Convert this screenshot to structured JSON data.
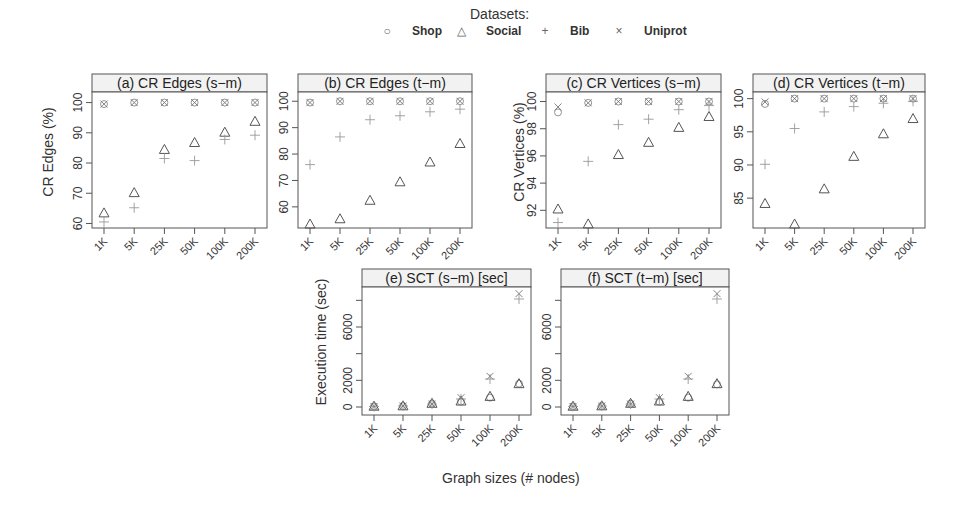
{
  "legend": {
    "title": "Datasets:",
    "items": [
      {
        "label": "Shop",
        "symbol": "○"
      },
      {
        "label": "Social",
        "symbol": "△"
      },
      {
        "label": "Bib",
        "symbol": "+"
      },
      {
        "label": "Uniprot",
        "symbol": "×"
      }
    ]
  },
  "xlabel": "Graph sizes (# nodes)",
  "ylabels": {
    "edges": "CR Edges (%)",
    "vertices": "CR Vertices (%)",
    "time": "Execution time (sec)"
  },
  "chart_data": [
    {
      "type": "scatter",
      "title": "(a) CR Edges (s−m)",
      "xlabel": "Graph sizes (# nodes)",
      "ylabel": "CR Edges (%)",
      "categories": [
        "1K",
        "5K",
        "25K",
        "50K",
        "100K",
        "200K"
      ],
      "yticks": [
        60,
        70,
        80,
        90,
        100
      ],
      "ylim": [
        58.5,
        103.5
      ],
      "series": [
        {
          "name": "Shop",
          "values": [
            99.5,
            100,
            100,
            100,
            100,
            100
          ]
        },
        {
          "name": "Social",
          "values": [
            63.5,
            70.2,
            84.5,
            86.8,
            90.2,
            93.8
          ]
        },
        {
          "name": "Bib",
          "values": [
            60.5,
            65.2,
            81.5,
            80.8,
            87.8,
            89.2
          ]
        },
        {
          "name": "Uniprot",
          "values": [
            99.5,
            100,
            100,
            100,
            100,
            100
          ]
        }
      ]
    },
    {
      "type": "scatter",
      "title": "(b) CR Edges (t−m)",
      "xlabel": "Graph sizes (# nodes)",
      "ylabel": "CR Edges (%)",
      "categories": [
        "1K",
        "5K",
        "25K",
        "50K",
        "100K",
        "200K"
      ],
      "yticks": [
        60,
        70,
        80,
        90,
        100
      ],
      "ylim": [
        52,
        103.5
      ],
      "series": [
        {
          "name": "Shop",
          "values": [
            99.5,
            100,
            100,
            100,
            100,
            100
          ]
        },
        {
          "name": "Social",
          "values": [
            53.5,
            55.5,
            62.5,
            69.5,
            77,
            84
          ]
        },
        {
          "name": "Bib",
          "values": [
            76,
            86.5,
            93,
            94.5,
            96,
            97
          ]
        },
        {
          "name": "Uniprot",
          "values": [
            99.5,
            100,
            100,
            100,
            100,
            100
          ]
        }
      ]
    },
    {
      "type": "scatter",
      "title": "(c) CR Vertices (s−m)",
      "xlabel": "Graph sizes (# nodes)",
      "ylabel": "CR Vertices (%)",
      "categories": [
        "1K",
        "5K",
        "25K",
        "50K",
        "100K",
        "200K"
      ],
      "yticks": [
        92,
        94,
        96,
        98,
        100
      ],
      "ylim": [
        90.7,
        100.7
      ],
      "series": [
        {
          "name": "Shop",
          "values": [
            99.2,
            99.9,
            100,
            100,
            100,
            100
          ]
        },
        {
          "name": "Social",
          "values": [
            92.1,
            91.0,
            96.1,
            97.0,
            98.1,
            98.9
          ]
        },
        {
          "name": "Bib",
          "values": [
            91.1,
            95.6,
            98.3,
            98.7,
            99.4,
            99.7
          ]
        },
        {
          "name": "Uniprot",
          "values": [
            99.6,
            99.9,
            100,
            100,
            100,
            100
          ]
        }
      ]
    },
    {
      "type": "scatter",
      "title": "(d) CR Vertices (t−m)",
      "xlabel": "Graph sizes (# nodes)",
      "ylabel": "CR Vertices (%)",
      "categories": [
        "1K",
        "5K",
        "25K",
        "50K",
        "100K",
        "200K"
      ],
      "yticks": [
        85,
        90,
        95,
        100
      ],
      "ylim": [
        80.5,
        101
      ],
      "series": [
        {
          "name": "Shop",
          "values": [
            99.2,
            100,
            100,
            100,
            100,
            100
          ]
        },
        {
          "name": "Social",
          "values": [
            84.2,
            81.1,
            86.4,
            91.3,
            94.7,
            97.0
          ]
        },
        {
          "name": "Bib",
          "values": [
            90.1,
            95.5,
            98.0,
            98.8,
            99.3,
            99.6
          ]
        },
        {
          "name": "Uniprot",
          "values": [
            99.5,
            100,
            100,
            100,
            100,
            100
          ]
        }
      ]
    },
    {
      "type": "scatter",
      "title": "(e) SCT (s−m) [sec]",
      "xlabel": "Graph sizes (# nodes)",
      "ylabel": "Execution time (sec)",
      "categories": [
        "1K",
        "5K",
        "25K",
        "50K",
        "100K",
        "200K"
      ],
      "yticks": [
        0,
        2000,
        4000,
        6000,
        8000
      ],
      "ytick_labels": [
        "0",
        "2000",
        "",
        "6000",
        ""
      ],
      "ylim": [
        -600,
        9000
      ],
      "series": [
        {
          "name": "Shop",
          "values": [
            50,
            80,
            250,
            400,
            700,
            1750
          ]
        },
        {
          "name": "Social",
          "values": [
            60,
            90,
            280,
            450,
            800,
            1750
          ]
        },
        {
          "name": "Bib",
          "values": [
            40,
            70,
            220,
            600,
            2100,
            8100
          ]
        },
        {
          "name": "Uniprot",
          "values": [
            40,
            70,
            220,
            700,
            2300,
            8500
          ]
        }
      ]
    },
    {
      "type": "scatter",
      "title": "(f) SCT (t−m) [sec]",
      "xlabel": "Graph sizes (# nodes)",
      "ylabel": "Execution time (sec)",
      "categories": [
        "1K",
        "5K",
        "25K",
        "50K",
        "100K",
        "200K"
      ],
      "yticks": [
        0,
        2000,
        4000,
        6000,
        8000
      ],
      "ytick_labels": [
        "0",
        "2000",
        "",
        "6000",
        ""
      ],
      "ylim": [
        -600,
        9000
      ],
      "series": [
        {
          "name": "Shop",
          "values": [
            50,
            80,
            250,
            400,
            700,
            1700
          ]
        },
        {
          "name": "Social",
          "values": [
            60,
            90,
            280,
            450,
            800,
            1750
          ]
        },
        {
          "name": "Bib",
          "values": [
            40,
            70,
            220,
            600,
            2100,
            8100
          ]
        },
        {
          "name": "Uniprot",
          "values": [
            40,
            70,
            220,
            700,
            2300,
            8500
          ]
        }
      ]
    }
  ]
}
